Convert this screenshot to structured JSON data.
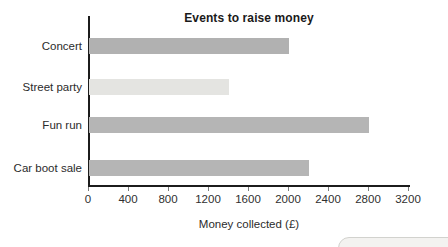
{
  "chart_data": {
    "type": "bar",
    "orientation": "horizontal",
    "title": "Events to raise money",
    "categories": [
      "Concert",
      "Street party",
      "Fun run",
      "Car boot sale"
    ],
    "values": [
      2000,
      1400,
      2800,
      2200
    ],
    "bar_colors": [
      "#b1b1b1",
      "#e4e4e1",
      "#b5b5b5",
      "#b5b5b5"
    ],
    "xlabel": "Money collected (£)",
    "xlim": [
      0,
      3200
    ],
    "xticks": [
      0,
      400,
      800,
      1200,
      1600,
      2000,
      2400,
      2800,
      3200
    ],
    "grid": false,
    "legend": "none"
  },
  "colors": {
    "axis": "#1c1c1c",
    "tick_mark": "#7a7a7a",
    "text": "#2b2b2b",
    "background": "#ffffff",
    "corner_pill_fill": "#f3f2f0",
    "corner_pill_border": "#d2d2ce"
  }
}
